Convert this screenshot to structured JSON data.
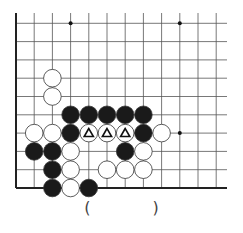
{
  "diagram": {
    "type": "go-board-fragment",
    "grid": {
      "columns": 12,
      "rows": 10,
      "origin_x": 16,
      "bottom_y": 188,
      "spacing_x": 18.2,
      "spacing_y": 18.3,
      "edges": [
        "left",
        "bottom"
      ],
      "line_color": "#555555",
      "edge_color": "#222222"
    },
    "star_points": [
      {
        "col": 3,
        "row": 9
      },
      {
        "col": 9,
        "row": 9
      },
      {
        "col": 9,
        "row": 3
      }
    ],
    "stones": [
      {
        "color": "white",
        "col": 2,
        "row": 6
      },
      {
        "color": "white",
        "col": 2,
        "row": 5
      },
      {
        "color": "black",
        "col": 3,
        "row": 4
      },
      {
        "color": "black",
        "col": 4,
        "row": 4
      },
      {
        "color": "black",
        "col": 5,
        "row": 4
      },
      {
        "color": "black",
        "col": 6,
        "row": 4
      },
      {
        "color": "black",
        "col": 7,
        "row": 4
      },
      {
        "color": "white",
        "col": 1,
        "row": 3
      },
      {
        "color": "white",
        "col": 2,
        "row": 3
      },
      {
        "color": "black",
        "col": 3,
        "row": 3
      },
      {
        "color": "white",
        "col": 4,
        "row": 3,
        "mark": "triangle"
      },
      {
        "color": "white",
        "col": 5,
        "row": 3,
        "mark": "triangle"
      },
      {
        "color": "white",
        "col": 6,
        "row": 3,
        "mark": "triangle"
      },
      {
        "color": "black",
        "col": 7,
        "row": 3
      },
      {
        "color": "white",
        "col": 8,
        "row": 3
      },
      {
        "color": "black",
        "col": 1,
        "row": 2
      },
      {
        "color": "black",
        "col": 2,
        "row": 2
      },
      {
        "color": "white",
        "col": 3,
        "row": 2
      },
      {
        "color": "black",
        "col": 6,
        "row": 2
      },
      {
        "color": "white",
        "col": 7,
        "row": 2
      },
      {
        "color": "black",
        "col": 2,
        "row": 1
      },
      {
        "color": "white",
        "col": 3,
        "row": 1
      },
      {
        "color": "white",
        "col": 5,
        "row": 1
      },
      {
        "color": "white",
        "col": 6,
        "row": 1
      },
      {
        "color": "white",
        "col": 7,
        "row": 1
      },
      {
        "color": "black",
        "col": 2,
        "row": 0
      },
      {
        "color": "white",
        "col": 3,
        "row": 0
      },
      {
        "color": "black",
        "col": 4,
        "row": 0
      }
    ],
    "colors": {
      "black_stone": "#1a1a1a",
      "white_stone": "#ffffff",
      "stone_outline": "#333333"
    }
  },
  "caption": {
    "open": "(",
    "close": ")"
  }
}
